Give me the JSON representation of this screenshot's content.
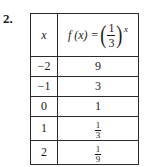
{
  "problem_number": "2.",
  "table": {
    "header": {
      "col1": "x",
      "col2": {
        "lhs": "f (x) =",
        "base_numerator": "1",
        "base_denominator": "3",
        "exponent": "x"
      }
    },
    "rows": [
      {
        "x": "−2",
        "fx": "9",
        "fx_num": null,
        "fx_den": null
      },
      {
        "x": "−1",
        "fx": "3",
        "fx_num": null,
        "fx_den": null
      },
      {
        "x": "0",
        "fx": "1",
        "fx_num": null,
        "fx_den": null
      },
      {
        "x": "1",
        "fx": null,
        "fx_num": "1",
        "fx_den": "3"
      },
      {
        "x": "2",
        "fx": null,
        "fx_num": "1",
        "fx_den": "9"
      }
    ]
  }
}
